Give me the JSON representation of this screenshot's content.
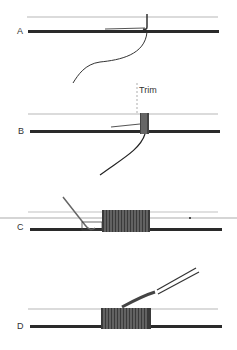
{
  "diagram": {
    "panels": [
      {
        "label": "A",
        "description": "thread laid along rod, tag end looped"
      },
      {
        "label": "B",
        "description": "first turns wrapped over tag end",
        "annotation": "Trim"
      },
      {
        "label": "C",
        "description": "wrap continued with pull-through loop inserted"
      },
      {
        "label": "D",
        "description": "completed wrap with tag end pulled through"
      }
    ],
    "colors": {
      "ink": "#222222",
      "rod_light": "#bbbbbb",
      "background": "#ffffff"
    }
  }
}
